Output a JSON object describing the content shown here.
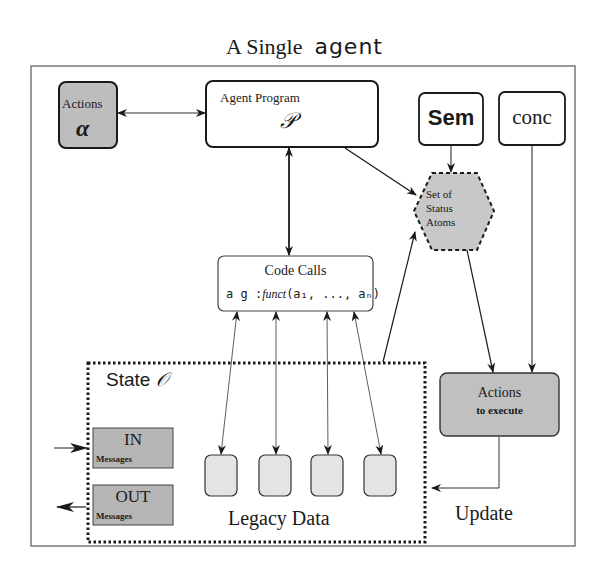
{
  "title": {
    "prefix": "A Single",
    "agent_word": "agent"
  },
  "nodes": {
    "actions": {
      "label": "Actions",
      "symbol": "α"
    },
    "agent_program": {
      "label": "Agent Program",
      "symbol": "𝒫"
    },
    "sem": {
      "label": "Sem"
    },
    "conc": {
      "label": "conc"
    },
    "status_atoms": {
      "line1": "Set of",
      "line2": "Status",
      "line3": "Atoms"
    },
    "code_calls": {
      "label": "Code Calls",
      "signature_prefix": "a g :",
      "signature_funct": "funct",
      "signature_args": "(a₁, ..., aₙ)"
    },
    "state": {
      "label": "State",
      "symbol": "𝒪"
    },
    "in_messages": {
      "label": "IN",
      "sublabel": "Messages"
    },
    "out_messages": {
      "label": "OUT",
      "sublabel": "Messages"
    },
    "legacy_data": {
      "label": "Legacy Data",
      "box_count": 4
    },
    "actions_to_execute": {
      "label": "Actions",
      "sublabel": "to execute"
    },
    "update": {
      "label": "Update"
    }
  },
  "edges": [
    {
      "from": "actions",
      "to": "agent_program",
      "type": "bidirectional"
    },
    {
      "from": "agent_program",
      "to": "code_calls",
      "type": "bidirectional"
    },
    {
      "from": "agent_program",
      "to": "status_atoms",
      "type": "directed"
    },
    {
      "from": "sem",
      "to": "status_atoms",
      "type": "directed"
    },
    {
      "from": "conc",
      "to": "actions_to_execute",
      "type": "directed"
    },
    {
      "from": "status_atoms",
      "to": "actions_to_execute",
      "type": "directed"
    },
    {
      "from": "state",
      "to": "status_atoms",
      "type": "directed"
    },
    {
      "from": "code_calls",
      "to": "legacy_data",
      "type": "bidirectional",
      "count": 4
    },
    {
      "from": "actions_to_execute",
      "to": "state",
      "type": "directed",
      "label": "Update"
    },
    {
      "from": "external",
      "to": "in_messages",
      "type": "directed"
    },
    {
      "from": "out_messages",
      "to": "external",
      "type": "directed"
    }
  ],
  "colors": {
    "box_fill_dark": "#bdbdbd",
    "box_fill_light": "#e4e4e4",
    "hex_fill": "#c8c8c8",
    "stroke": "#1a1a1a",
    "frame": "#555555"
  }
}
